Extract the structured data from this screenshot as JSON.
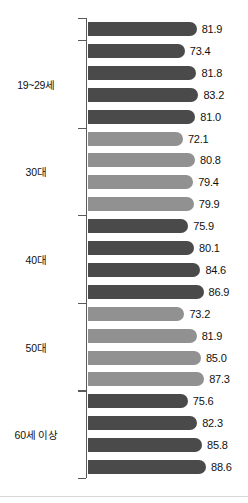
{
  "chart_data": {
    "type": "bar",
    "orientation": "horizontal",
    "title": "",
    "subtitle": "",
    "xlabel": "",
    "ylabel": "",
    "xlim": [
      0,
      100
    ],
    "grid": false,
    "legend": "none",
    "value_format": "one-decimal",
    "categories": [
      "전체",
      "1단계",
      "2단계",
      "3단계",
      "4단계",
      "1단계",
      "2단계",
      "3단계",
      "4단계",
      "1단계",
      "2단계",
      "3단계",
      "4단계",
      "1단계",
      "2단계",
      "3단계",
      "4단계",
      "1단계",
      "2단계",
      "3단계",
      "4단계"
    ],
    "values": [
      81.9,
      73.4,
      81.8,
      83.2,
      81.0,
      72.1,
      80.8,
      79.4,
      79.9,
      75.9,
      80.1,
      84.6,
      86.9,
      73.2,
      81.9,
      85.0,
      87.3,
      75.6,
      82.3,
      85.8,
      88.6
    ],
    "bars": [
      {
        "label": "전체",
        "value": 81.9,
        "group": "전체",
        "shade": "dark"
      },
      {
        "label": "1단계",
        "value": 73.4,
        "group": "19~29세",
        "shade": "dark"
      },
      {
        "label": "2단계",
        "value": 81.8,
        "group": "19~29세",
        "shade": "dark"
      },
      {
        "label": "3단계",
        "value": 83.2,
        "group": "19~29세",
        "shade": "dark"
      },
      {
        "label": "4단계",
        "value": 81.0,
        "group": "19~29세",
        "shade": "dark"
      },
      {
        "label": "1단계",
        "value": 72.1,
        "group": "30대",
        "shade": "light"
      },
      {
        "label": "2단계",
        "value": 80.8,
        "group": "30대",
        "shade": "light"
      },
      {
        "label": "3단계",
        "value": 79.4,
        "group": "30대",
        "shade": "light"
      },
      {
        "label": "4단계",
        "value": 79.9,
        "group": "30대",
        "shade": "light"
      },
      {
        "label": "1단계",
        "value": 75.9,
        "group": "40대",
        "shade": "dark"
      },
      {
        "label": "2단계",
        "value": 80.1,
        "group": "40대",
        "shade": "dark"
      },
      {
        "label": "3단계",
        "value": 84.6,
        "group": "40대",
        "shade": "dark"
      },
      {
        "label": "4단계",
        "value": 86.9,
        "group": "40대",
        "shade": "dark"
      },
      {
        "label": "1단계",
        "value": 73.2,
        "group": "50대",
        "shade": "light"
      },
      {
        "label": "2단계",
        "value": 81.9,
        "group": "50대",
        "shade": "light"
      },
      {
        "label": "3단계",
        "value": 85.0,
        "group": "50대",
        "shade": "light"
      },
      {
        "label": "4단계",
        "value": 87.3,
        "group": "50대",
        "shade": "light"
      },
      {
        "label": "1단계",
        "value": 75.6,
        "group": "60세 이상",
        "shade": "dark"
      },
      {
        "label": "2단계",
        "value": 82.3,
        "group": "60세 이상",
        "shade": "dark"
      },
      {
        "label": "3단계",
        "value": 85.8,
        "group": "60세 이상",
        "shade": "dark"
      },
      {
        "label": "4단계",
        "value": 88.6,
        "group": "60세 이상",
        "shade": "dark"
      }
    ],
    "groups": [
      {
        "label": "19~29세",
        "start_index": 1,
        "count": 4
      },
      {
        "label": "30대",
        "start_index": 5,
        "count": 4
      },
      {
        "label": "40대",
        "start_index": 9,
        "count": 4
      },
      {
        "label": "50대",
        "start_index": 13,
        "count": 4
      },
      {
        "label": "60세 이상",
        "start_index": 17,
        "count": 4
      }
    ],
    "colors": {
      "bar_dark": "#4a4a4a",
      "bar_light": "#919191",
      "axis": "#5a5a5a",
      "text": "#111111",
      "background": "#ffffff"
    }
  }
}
